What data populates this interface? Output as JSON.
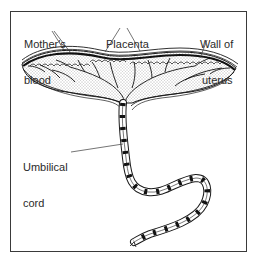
{
  "diagram": {
    "labels": {
      "mothers_blood_line1": "Mother's",
      "mothers_blood_line2": "blood",
      "placenta": "Placenta",
      "wall_of_uterus_line1": "Wall of",
      "wall_of_uterus_line2": "uterus",
      "umbilical_cord_line1": "Umbilical",
      "umbilical_cord_line2": "cord"
    },
    "colors": {
      "ink": "#1a1a1a",
      "background": "#ffffff",
      "frame": "#3a3a3a"
    }
  }
}
